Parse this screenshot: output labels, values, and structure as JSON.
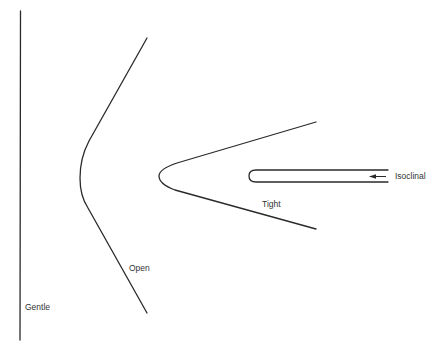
{
  "diagram": {
    "type": "fold-tightness-classification",
    "stroke_color": "#2a2a2a",
    "background": "#ffffff",
    "folds": [
      {
        "id": "gentle",
        "label": "Gentle",
        "shape": "near-straight vertical line"
      },
      {
        "id": "open",
        "label": "Open",
        "shape": "wide angle fold, hinge pointing left"
      },
      {
        "id": "tight",
        "label": "Tight",
        "shape": "acute fold, hinge pointing left"
      },
      {
        "id": "isoclinal",
        "label": "Isoclinal",
        "shape": "parallel limbs, hinge pointing left",
        "pointer": "arrow-left-icon"
      }
    ]
  }
}
